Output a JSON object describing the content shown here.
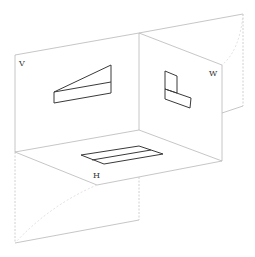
{
  "diagram": {
    "planes": {
      "V": {
        "label": "V",
        "name": "Vertical projection plane"
      },
      "H": {
        "label": "H",
        "name": "Horizontal projection plane"
      },
      "W": {
        "label": "W",
        "name": "Side (profile) projection plane"
      }
    },
    "colors": {
      "plane_edge": "#b8b8b8",
      "projection": "#3a3a3a",
      "label": "#333333",
      "background": "#ffffff"
    },
    "projections": [
      {
        "plane": "V",
        "shape": "tapered wedge (front view)"
      },
      {
        "plane": "W",
        "shape": "L-shape (side view)"
      },
      {
        "plane": "H",
        "shape": "parallelogram with divider line (top view)"
      }
    ],
    "unfolding": {
      "W_rotated": "W plane rotated outward (dashed arc)",
      "H_rotated": "H plane rotated downward (dashed arc)"
    }
  }
}
